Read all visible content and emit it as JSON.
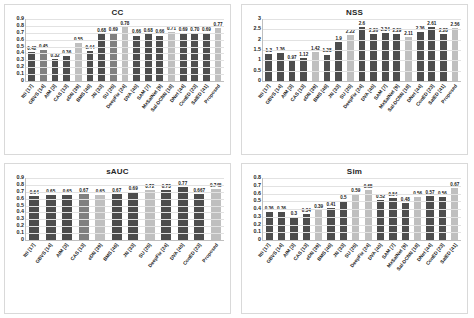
{
  "figure": {
    "background": "#ffffff",
    "bar_colors": {
      "dark": "#4d4d4d",
      "mid": "#808080",
      "light": "#bfbfbf"
    }
  },
  "chart_data": [
    {
      "type": "bar",
      "title": "CC",
      "xlabel": "",
      "ylabel": "",
      "ylim": [
        0,
        0.9
      ],
      "grid": true,
      "legend": "none",
      "yticks": [
        "0.9",
        "0.8",
        "0.7",
        "0.6",
        "0.5",
        "0.4",
        "0.3",
        "0.2",
        "0.1",
        "0"
      ],
      "categories": [
        "Itti [17]",
        "GBVS [14]",
        "AIM [3]",
        "CAS [13]",
        "eDN [39]",
        "BMS [46]",
        "JN [33]",
        "SU [25]",
        "DeepFix [24]",
        "DVA [40]",
        "SAM [7]",
        "MxSalNet [9]",
        "Sal-DCNN [18]",
        "DNet [44]",
        "ConED [23]",
        "SalED [41]",
        "Proposed"
      ],
      "values": [
        0.42,
        0.45,
        0.32,
        0.36,
        0.55,
        0.44,
        0.68,
        0.69,
        0.78,
        0.66,
        0.68,
        0.66,
        0.71,
        0.69,
        0.7,
        0.69,
        0.77
      ],
      "labels": [
        "0.42",
        "0.45",
        "0.32",
        "0.36",
        "0.55",
        "0.44",
        "0.68",
        "0.69",
        "0.78",
        "0.66",
        "0.68",
        "0.66",
        "0.71",
        "0.69",
        "0.70",
        "0.69",
        "0.77"
      ],
      "shades": [
        "dark",
        "mid",
        "dark",
        "dark",
        "light",
        "dark",
        "dark",
        "mid",
        "light",
        "dark",
        "dark",
        "dark",
        "light",
        "dark",
        "dark",
        "dark",
        "light"
      ]
    },
    {
      "type": "bar",
      "title": "NSS",
      "xlabel": "",
      "ylabel": "",
      "ylim": [
        0,
        3
      ],
      "grid": true,
      "legend": "none",
      "yticks": [
        "3",
        "2.5",
        "2",
        "1.5",
        "1",
        "0.5",
        "0"
      ],
      "categories": [
        "Itti [17]",
        "GBVS [14]",
        "AIM [3]",
        "CAS [13]",
        "eDN [39]",
        "BMS [46]",
        "JN [33]",
        "SU [25]",
        "DeepFix [24]",
        "DVA [40]",
        "SAM [7]",
        "MxSalNet [9]",
        "Sal-DCNN [18]",
        "DNet [44]",
        "ConED [23]",
        "SalED [41]",
        "Proposed"
      ],
      "values": [
        1.3,
        1.36,
        0.97,
        1.12,
        1.42,
        1.28,
        1.9,
        2.22,
        2.6,
        2.26,
        2.34,
        2.29,
        2.11,
        2.36,
        2.61,
        2.28,
        2.56
      ],
      "labels": [
        "1.3",
        "1.36",
        "0.97",
        "1.12",
        "1.42",
        "1.28",
        "1.9",
        "2.22",
        "2.6",
        "2.26",
        "2.34",
        "2.29",
        "2.11",
        "2.36",
        "2.61",
        "2.28",
        "2.56"
      ],
      "shades": [
        "dark",
        "dark",
        "dark",
        "dark",
        "light",
        "dark",
        "dark",
        "light",
        "dark",
        "dark",
        "dark",
        "dark",
        "light",
        "dark",
        "dark",
        "dark",
        "light"
      ]
    },
    {
      "type": "bar",
      "title": "sAUC",
      "xlabel": "",
      "ylabel": "",
      "ylim": [
        0,
        0.9
      ],
      "grid": true,
      "legend": "none",
      "yticks": [
        "0.9",
        "0.8",
        "0.7",
        "0.6",
        "0.5",
        "0.4",
        "0.3",
        "0.2",
        "0.1",
        "0"
      ],
      "categories": [
        "Itti [17]",
        "GBVS [14]",
        "AIM [3]",
        "CAS [13]",
        "eDN [39]",
        "BMS [46]",
        "JN [33]",
        "SU [25]",
        "DeepFix [24]",
        "DVA [40]",
        "ConED [23]",
        "Proposed"
      ],
      "values": [
        0.64,
        0.65,
        0.65,
        0.67,
        0.65,
        0.67,
        0.69,
        0.72,
        0.73,
        0.77,
        0.667,
        0.745
      ],
      "labels": [
        "0.64",
        "0.65",
        "0.65",
        "0.67",
        "0.65",
        "0.67",
        "0.69",
        "0.72",
        "0.73",
        "0.77",
        "0.667",
        "0.745"
      ],
      "shades": [
        "dark",
        "dark",
        "dark",
        "mid",
        "light",
        "dark",
        "dark",
        "light",
        "dark",
        "dark",
        "dark",
        "light"
      ]
    },
    {
      "type": "bar",
      "title": "Sim",
      "xlabel": "",
      "ylabel": "",
      "ylim": [
        0,
        0.8
      ],
      "grid": true,
      "legend": "none",
      "yticks": [
        "0.8",
        "0.7",
        "0.6",
        "0.5",
        "0.4",
        "0.3",
        "0.2",
        "0.1",
        "0"
      ],
      "categories": [
        "Itti [17]",
        "GBVS [14]",
        "AIM [3]",
        "CAS [13]",
        "eDN [39]",
        "BMS [46]",
        "JN [33]",
        "SU [25]",
        "DeepFix [24]",
        "DVA [40]",
        "SAM [7]",
        "MxSalNet [9]",
        "Sal-DCNN [18]",
        "DNet [44]",
        "ConED [23]",
        "SalED [41]"
      ],
      "values": [
        0.36,
        0.36,
        0.3,
        0.34,
        0.39,
        0.41,
        0.5,
        0.59,
        0.65,
        0.52,
        0.54,
        0.48,
        0.56,
        0.57,
        0.56,
        0.67
      ],
      "labels": [
        "0.36",
        "0.36",
        "0.3",
        "0.34",
        "0.39",
        "0.41",
        "0.5",
        "0.59",
        "0.65",
        "0.52",
        "0.54",
        "0.48",
        "0.56",
        "0.57",
        "0.56",
        "0.67"
      ],
      "shades": [
        "dark",
        "dark",
        "dark",
        "dark",
        "light",
        "dark",
        "dark",
        "light",
        "light",
        "dark",
        "dark",
        "dark",
        "light",
        "dark",
        "dark",
        "light"
      ]
    }
  ]
}
